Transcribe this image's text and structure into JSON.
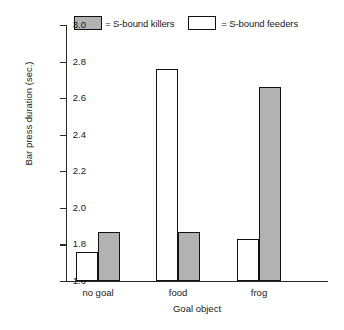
{
  "chart_data": {
    "type": "bar",
    "title": "",
    "xlabel": "Goal object",
    "ylabel": "Bar press duration (sec.)",
    "categories": [
      "no goal",
      "food",
      "frog"
    ],
    "ylim": [
      1.6,
      3.0
    ],
    "yticks": [
      "3.0",
      "2.8",
      "2.6",
      "2.4",
      "2.2",
      "2.0",
      "1.8",
      "1.6"
    ],
    "ytick_values": [
      3.0,
      2.8,
      2.6,
      2.4,
      2.2,
      2.0,
      1.8,
      1.6
    ],
    "grid": false,
    "legend_position": "top",
    "series": [
      {
        "name": "S-bound feeders",
        "swatch": "empty",
        "color": "#ffffff",
        "values": [
          1.76,
          2.76,
          1.83
        ]
      },
      {
        "name": "S-bound killers",
        "swatch": "filled",
        "color": "#b2b2b2",
        "values": [
          1.87,
          1.87,
          2.66
        ]
      }
    ]
  },
  "legend": {
    "entries": [
      {
        "equals": "= S-bound killers",
        "swatch": "filled"
      },
      {
        "equals": "= S-bound feeders",
        "swatch": "empty"
      }
    ]
  }
}
